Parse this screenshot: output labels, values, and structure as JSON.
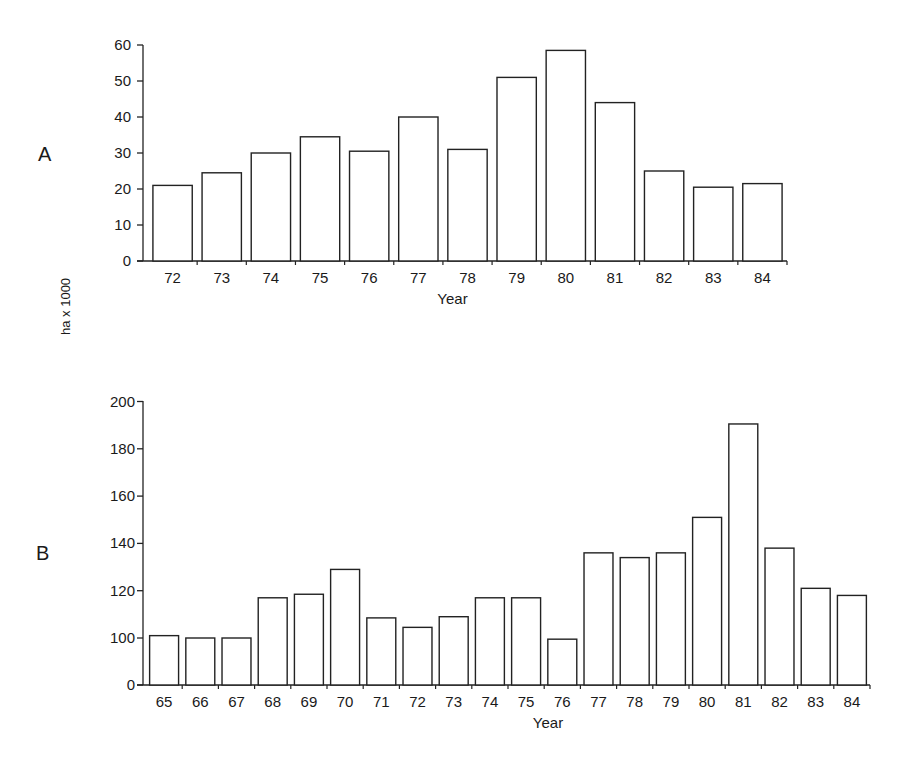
{
  "figure": {
    "ylabel": "ha x 1000",
    "panels": [
      {
        "label": "A",
        "xlabel": "Year"
      },
      {
        "label": "B",
        "xlabel": "Year"
      }
    ]
  },
  "chart_data": [
    {
      "type": "bar",
      "panel": "A",
      "title": "",
      "xlabel": "Year",
      "ylabel": "ha x 1000",
      "categories": [
        "72",
        "73",
        "74",
        "75",
        "76",
        "77",
        "78",
        "79",
        "80",
        "81",
        "82",
        "83",
        "84"
      ],
      "values": [
        21,
        24.5,
        30,
        34.5,
        30.5,
        40,
        31,
        51,
        58.5,
        44,
        25,
        20.5,
        21.5
      ],
      "yticks": [
        0,
        10,
        20,
        30,
        40,
        50,
        60
      ],
      "ylim": [
        0,
        60
      ],
      "grid": false,
      "legend": null
    },
    {
      "type": "bar",
      "panel": "B",
      "title": "",
      "xlabel": "Year",
      "ylabel": "ha x 1000",
      "categories": [
        "65",
        "66",
        "67",
        "68",
        "69",
        "70",
        "71",
        "72",
        "73",
        "74",
        "75",
        "76",
        "77",
        "78",
        "79",
        "80",
        "81",
        "82",
        "83",
        "84"
      ],
      "values": [
        101,
        100,
        100,
        117,
        118.5,
        129,
        108.5,
        104.5,
        109,
        117,
        117,
        97.5,
        136,
        134,
        136,
        151,
        190.5,
        138,
        121,
        118
      ],
      "yticks": [
        0,
        100,
        120,
        140,
        160,
        180,
        200
      ],
      "ylim": [
        0,
        200
      ],
      "axis_break": "between 0 and 100 (tick spacing uniform)",
      "grid": false,
      "legend": null
    }
  ]
}
